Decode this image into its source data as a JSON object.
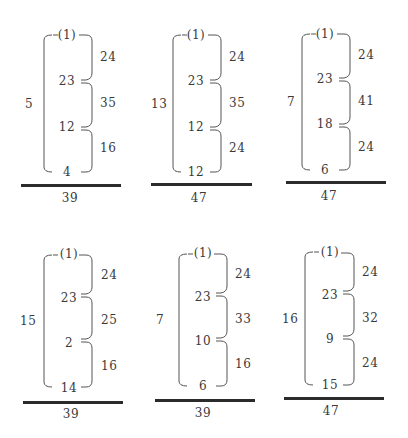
{
  "figure": {
    "panels": [
      {
        "id": "panel-1",
        "outer_label": "5",
        "nodes": [
          "(1)",
          "23",
          "12",
          "4"
        ],
        "gaps": [
          "24",
          "35",
          "16"
        ],
        "total": "39"
      },
      {
        "id": "panel-2",
        "outer_label": "13",
        "nodes": [
          "(1)",
          "23",
          "12",
          "12"
        ],
        "gaps": [
          "24",
          "35",
          "24"
        ],
        "total": "47"
      },
      {
        "id": "panel-3",
        "outer_label": "7",
        "nodes": [
          "(1)",
          "23",
          "18",
          "6"
        ],
        "gaps": [
          "24",
          "41",
          "24"
        ],
        "total": "47"
      },
      {
        "id": "panel-4",
        "outer_label": "15",
        "nodes": [
          "(1)",
          "23",
          "2",
          "14"
        ],
        "gaps": [
          "24",
          "25",
          "16"
        ],
        "total": "39"
      },
      {
        "id": "panel-5",
        "outer_label": "7",
        "nodes": [
          "(1)",
          "23",
          "10",
          "6"
        ],
        "gaps": [
          "24",
          "33",
          "16"
        ],
        "total": "39"
      },
      {
        "id": "panel-6",
        "outer_label": "16",
        "nodes": [
          "(1)",
          "23",
          "9",
          "15"
        ],
        "gaps": [
          "24",
          "32",
          "24"
        ],
        "total": "47"
      }
    ]
  }
}
